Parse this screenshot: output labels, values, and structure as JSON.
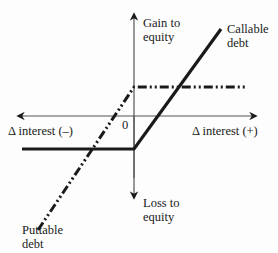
{
  "diagram": {
    "type": "payoff-diagram",
    "axes": {
      "y_top_label_line1": "Gain to",
      "y_top_label_line2": "equity",
      "y_bottom_label_line1": "Loss to",
      "y_bottom_label_line2": "equity",
      "x_left_label": "Δ interest (–)",
      "x_right_label": "Δ interest (+)",
      "origin_label": "0"
    },
    "series": [
      {
        "name": "Callable debt",
        "label_line1": "Callable",
        "label_line2": "debt",
        "style": "solid",
        "description": "Flat below zero for negative Δ interest, rising linearly for positive Δ interest"
      },
      {
        "name": "Puttable debt",
        "label_line1": "Puttable",
        "label_line2": "debt",
        "style": "dash-dot-dot",
        "description": "Rising linearly for negative Δ interest up to a positive cap, flat above zero for positive Δ interest"
      }
    ],
    "colors": {
      "ink": "#1a1a1a",
      "axis": "#555555",
      "background": "#fdfdfd"
    }
  }
}
